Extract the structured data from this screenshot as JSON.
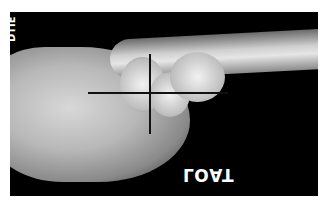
{
  "image": {
    "type": "x-ray",
    "view": "lateral wrist",
    "side_label": "DTIE",
    "marker_text": "LOAT",
    "crosshair": {
      "center_x": 150,
      "center_y": 93
    }
  }
}
